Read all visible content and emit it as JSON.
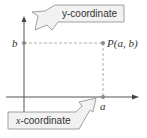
{
  "diagram": {
    "type": "coordinate-plane-point",
    "point_label": "P(a, b)",
    "x_label": "a",
    "y_label": "b",
    "callouts": {
      "y": {
        "var": "",
        "text": "y-coordinate"
      },
      "x": {
        "var": "x",
        "text": "-coordinate"
      }
    },
    "colors": {
      "axis": "#555555",
      "dashed": "#9a9a9a",
      "point": "#8a8a8a",
      "callout_fill": "#f2f2f2",
      "callout_stroke": "#8a8a8a"
    }
  }
}
